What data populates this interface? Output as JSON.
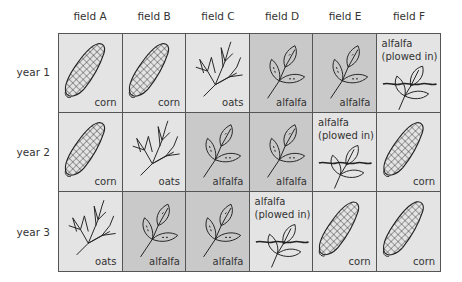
{
  "columns": [
    "field A",
    "field B",
    "field C",
    "field D",
    "field E",
    "field F"
  ],
  "rows": [
    "year 1",
    "year 2",
    "year 3"
  ],
  "colors": {
    "light_cell": "#e4e4e4",
    "dark_cell": "#c9c9c9",
    "border": "#555555",
    "ink": "#222222"
  },
  "labels": {
    "corn": "corn",
    "oats": "oats",
    "alfalfa": "alfalfa",
    "alfalfa_plowed_line1": "alfalfa",
    "alfalfa_plowed_line2": "(plowed in)"
  },
  "grid": [
    [
      {
        "crop": "corn",
        "icon": "corn-icon",
        "shade": "light"
      },
      {
        "crop": "corn",
        "icon": "corn-icon",
        "shade": "light"
      },
      {
        "crop": "oats",
        "icon": "oats-icon",
        "shade": "light"
      },
      {
        "crop": "alfalfa",
        "icon": "alfalfa-icon",
        "shade": "dark"
      },
      {
        "crop": "alfalfa",
        "icon": "alfalfa-icon",
        "shade": "dark"
      },
      {
        "crop": "alfalfa (plowed in)",
        "icon": "alfalfa-plowed-icon",
        "shade": "light"
      }
    ],
    [
      {
        "crop": "corn",
        "icon": "corn-icon",
        "shade": "light"
      },
      {
        "crop": "oats",
        "icon": "oats-icon",
        "shade": "light"
      },
      {
        "crop": "alfalfa",
        "icon": "alfalfa-icon",
        "shade": "dark"
      },
      {
        "crop": "alfalfa",
        "icon": "alfalfa-icon",
        "shade": "dark"
      },
      {
        "crop": "alfalfa (plowed in)",
        "icon": "alfalfa-plowed-icon",
        "shade": "light"
      },
      {
        "crop": "corn",
        "icon": "corn-icon",
        "shade": "light"
      }
    ],
    [
      {
        "crop": "oats",
        "icon": "oats-icon",
        "shade": "light"
      },
      {
        "crop": "alfalfa",
        "icon": "alfalfa-icon",
        "shade": "dark"
      },
      {
        "crop": "alfalfa",
        "icon": "alfalfa-icon",
        "shade": "dark"
      },
      {
        "crop": "alfalfa (plowed in)",
        "icon": "alfalfa-plowed-icon",
        "shade": "light"
      },
      {
        "crop": "corn",
        "icon": "corn-icon",
        "shade": "light"
      },
      {
        "crop": "corn",
        "icon": "corn-icon",
        "shade": "light"
      }
    ]
  ]
}
